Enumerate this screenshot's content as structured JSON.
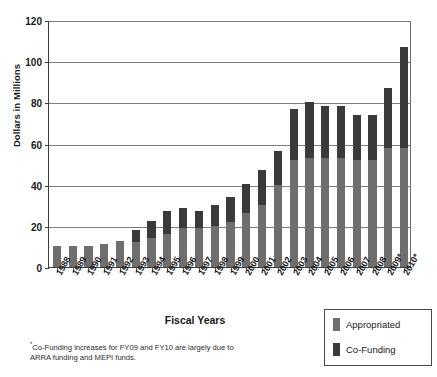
{
  "chart_data": {
    "type": "bar",
    "stacked": true,
    "title": "",
    "xlabel": "Fiscal Years",
    "ylabel": "Dollars in Millions",
    "ylim": [
      0,
      120
    ],
    "ytick_step": 20,
    "yticks": [
      0,
      20,
      40,
      60,
      80,
      100,
      120
    ],
    "ytick_labels": [
      "0",
      "20",
      "40",
      "60",
      "80",
      "100",
      "120"
    ],
    "grid": true,
    "legend_position": "bottom-right",
    "categories": [
      "1988",
      "1989",
      "1990",
      "1991",
      "1992",
      "1993",
      "1994",
      "1995",
      "1996",
      "1997",
      "1998",
      "1999",
      "2000",
      "2001",
      "2002",
      "2003",
      "2004",
      "2005",
      "2006",
      "2007",
      "2008",
      "2009*",
      "2010*"
    ],
    "series": [
      {
        "name": "Appropriated",
        "color": "#6e6e6e",
        "values": [
          10,
          10,
          10,
          11,
          12.5,
          12,
          14,
          16,
          19,
          19,
          20,
          22,
          26,
          30,
          40,
          52,
          53,
          53,
          53,
          52,
          52,
          58,
          58
        ]
      },
      {
        "name": "Co-Funding",
        "color": "#3a3a3a",
        "values": [
          0,
          0,
          0,
          0,
          0,
          6,
          8.5,
          11,
          9.5,
          8,
          10,
          12,
          14.5,
          17,
          16.5,
          25,
          27,
          25,
          25,
          22,
          22,
          29,
          49
        ]
      }
    ],
    "totals": [
      10,
      10,
      10,
      11,
      12.5,
      18,
      22.5,
      27,
      28.5,
      27,
      30,
      34,
      40.5,
      47,
      56.5,
      77,
      80,
      78,
      78,
      74,
      74,
      87,
      107
    ],
    "annotations": [
      "*Co-Funding increases for FY09 and FY10 are largely due to ARRA funding and MEPI funds."
    ]
  },
  "axes": {
    "y_title": "Dollars in Millions",
    "x_title": "Fiscal Years"
  },
  "legend": {
    "items": [
      {
        "label": "Appropriated",
        "color": "#6e6e6e"
      },
      {
        "label": "Co-Funding",
        "color": "#3a3a3a"
      }
    ]
  },
  "footnote": {
    "marker": "*",
    "text": "Co-Funding increases for FY09 and FY10 are largely due to ARRA funding and MEPI funds."
  }
}
